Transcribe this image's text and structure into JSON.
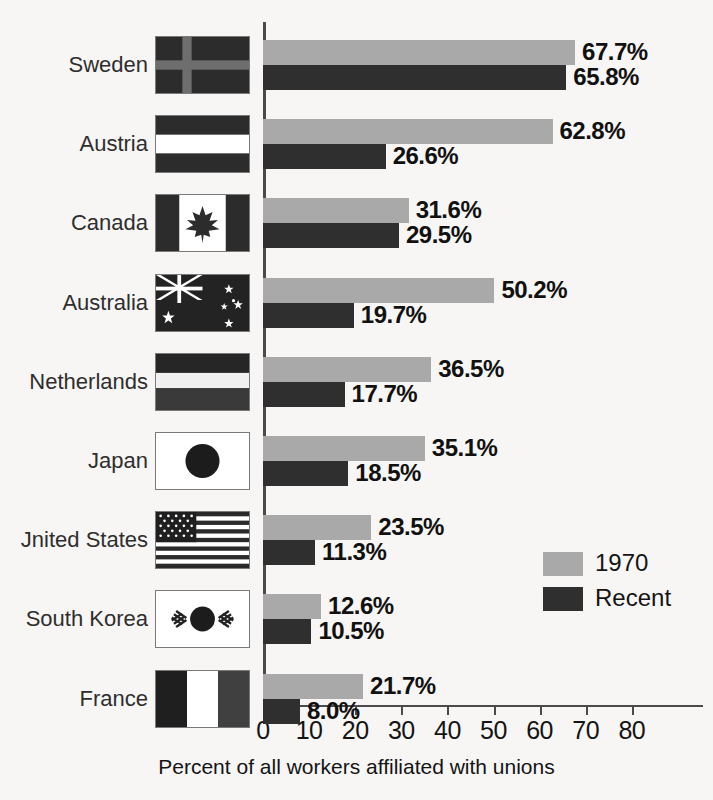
{
  "chart_data": {
    "type": "bar",
    "orientation": "horizontal",
    "title": "",
    "xlabel": "Percent of all workers affiliated with unions",
    "ylabel": "",
    "xlim": [
      0,
      80
    ],
    "xticks": [
      0,
      10,
      20,
      30,
      40,
      50,
      60,
      70,
      80
    ],
    "xtick_labels": [
      "0",
      "10",
      "20",
      "30",
      "40",
      "50",
      "60",
      "70",
      "80"
    ],
    "grid": false,
    "legend_position": "center-right",
    "categories": [
      "Sweden",
      "Austria",
      "Canada",
      "Australia",
      "Netherlands",
      "Japan",
      "United States",
      "South Korea",
      "France"
    ],
    "category_labels_rendered": [
      "Sweden",
      "Austria",
      "Canada",
      "Australia",
      "Netherlands",
      "Japan",
      "Jnited States",
      "South Korea",
      "France"
    ],
    "series": [
      {
        "name": "1970",
        "color": "#a9a9a9",
        "values": [
          67.7,
          62.8,
          31.6,
          50.2,
          36.5,
          35.1,
          23.5,
          12.6,
          21.7
        ],
        "labels": [
          "67.7%",
          "62.8%",
          "31.6%",
          "50.2%",
          "36.5%",
          "35.1%",
          "23.5%",
          "12.6%",
          "21.7%"
        ]
      },
      {
        "name": "Recent",
        "color": "#302f2f",
        "values": [
          65.8,
          26.6,
          29.5,
          19.7,
          17.7,
          18.5,
          11.3,
          10.5,
          8.0
        ],
        "labels": [
          "65.8%",
          "26.6%",
          "29.5%",
          "19.7%",
          "17.7%",
          "18.5%",
          "11.3%",
          "10.5%",
          "8.0%"
        ]
      }
    ],
    "flags": [
      "sweden-flag",
      "austria-flag",
      "canada-flag",
      "australia-flag",
      "netherlands-flag",
      "japan-flag",
      "united-states-flag",
      "south-korea-flag",
      "france-flag"
    ]
  },
  "legend": {
    "items": [
      {
        "label": "1970",
        "color": "#a9a9a9"
      },
      {
        "label": "Recent",
        "color": "#302f2f"
      }
    ]
  },
  "axis": {
    "x_title": "Percent of all workers affiliated with unions"
  }
}
